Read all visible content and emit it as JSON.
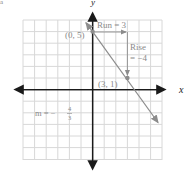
{
  "diagram": {
    "type": "coordinate-plane-slope",
    "partial_label_top_left": "a",
    "axes": {
      "x_label": "x",
      "y_label": "y"
    },
    "grid": {
      "x_min": -6,
      "x_max": 6,
      "y_min": -6,
      "y_max": 6
    },
    "points": [
      {
        "label": "(0, 5)",
        "x": 0,
        "y": 5
      },
      {
        "label": "(3, 1)",
        "x": 3,
        "y": 1
      }
    ],
    "line": {
      "through": [
        [
          0,
          5
        ],
        [
          3,
          1
        ]
      ],
      "slope": "-4/3"
    },
    "annotations": {
      "run": "Run = 3",
      "rise_line1": "Rise",
      "rise_line2": "= −4",
      "slope_m": "m = −",
      "slope_num": "4",
      "slope_den": "3"
    },
    "colors": {
      "grid": "#d8d8d8",
      "axis": "#1a1a1a",
      "line": "#8c8c8c",
      "text": "#8a8a8a"
    }
  }
}
